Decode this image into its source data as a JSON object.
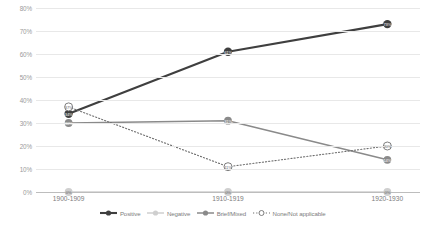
{
  "chart_data": {
    "type": "line",
    "title": "",
    "xlabel": "",
    "ylabel": "",
    "categories": [
      "1900-1909",
      "1910-1919",
      "1920-1930"
    ],
    "ylim": [
      0,
      80
    ],
    "yticks": [
      "0%",
      "10%",
      "20%",
      "30%",
      "40%",
      "50%",
      "60%",
      "70%",
      "80%"
    ],
    "ytick_values": [
      0,
      10,
      20,
      30,
      40,
      50,
      60,
      70,
      80
    ],
    "grid": true,
    "legend_position": "bottom",
    "series": [
      {
        "name": "Positive",
        "color": "#3f3f3f",
        "style": "solid",
        "marker": "filled-circle",
        "values": [
          34,
          61,
          73
        ],
        "labels": [
          "34%",
          "61%",
          "73%"
        ]
      },
      {
        "name": "Negative",
        "color": "#cfcfcf",
        "style": "solid",
        "marker": "filled-circle",
        "values": [
          0,
          0,
          0
        ],
        "labels": [
          "0%",
          "0%",
          "0%"
        ]
      },
      {
        "name": "Brief/Mixed",
        "color": "#8a8a8a",
        "style": "solid",
        "marker": "filled-circle",
        "values": [
          30,
          31,
          14
        ],
        "labels": [
          "30%",
          "31%",
          "14%"
        ]
      },
      {
        "name": "None/Not applicable",
        "color": "#6f6f6f",
        "style": "dotted",
        "marker": "open-circle",
        "values": [
          37,
          11,
          20
        ],
        "labels": [
          "37%",
          "11%",
          "20%"
        ]
      }
    ]
  }
}
